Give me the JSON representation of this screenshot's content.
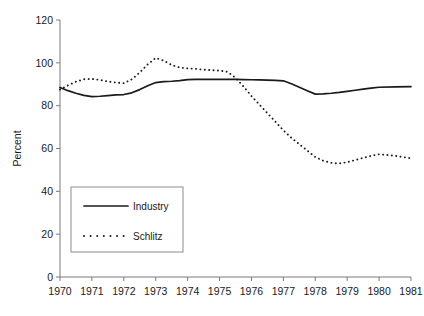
{
  "chart_data": {
    "type": "line",
    "title": "",
    "subtitle": "",
    "xlabel": "",
    "ylabel": "Percent",
    "xlim": [
      1970,
      1981
    ],
    "ylim": [
      0,
      120
    ],
    "grid": false,
    "legend_position": "inside-lower-left",
    "x_tick_labels": [
      "1970",
      "1971",
      "1972",
      "1973",
      "1974",
      "1975",
      "1976",
      "1977",
      "1978",
      "1979",
      "1980",
      "1981"
    ],
    "x_ticks": [
      1970,
      1971,
      1972,
      1973,
      1974,
      1975,
      1976,
      1977,
      1978,
      1979,
      1980,
      1981
    ],
    "y_tick_labels": [
      "0",
      "20",
      "40",
      "60",
      "80",
      "100",
      "120"
    ],
    "y_ticks": [
      0,
      20,
      40,
      60,
      80,
      100,
      120
    ],
    "series": [
      {
        "name": "Industry",
        "style": "solid",
        "color": "#1a1a1a",
        "x": [
          1970.0,
          1970.25,
          1970.5,
          1970.75,
          1971.0,
          1971.25,
          1971.5,
          1971.75,
          1972.0,
          1972.25,
          1972.5,
          1972.75,
          1973.0,
          1973.25,
          1973.5,
          1973.75,
          1974.0,
          1974.25,
          1974.5,
          1974.75,
          1975.0,
          1975.25,
          1975.5,
          1975.75,
          1976.0,
          1976.25,
          1976.5,
          1976.75,
          1977.0,
          1977.25,
          1977.5,
          1977.75,
          1978.0,
          1978.25,
          1978.5,
          1978.75,
          1979.0,
          1979.25,
          1979.5,
          1979.75,
          1980.0,
          1980.5,
          1981.0
        ],
        "values": [
          88.5,
          87.0,
          85.8,
          84.8,
          84.2,
          84.4,
          84.7,
          85.0,
          85.2,
          86.0,
          87.5,
          89.3,
          90.8,
          91.2,
          91.4,
          91.7,
          92.2,
          92.3,
          92.3,
          92.3,
          92.3,
          92.3,
          92.3,
          92.2,
          92.1,
          92.0,
          91.9,
          91.8,
          91.6,
          90.2,
          88.6,
          87.0,
          85.4,
          85.5,
          85.8,
          86.2,
          86.7,
          87.2,
          87.7,
          88.2,
          88.6,
          88.8,
          88.9
        ]
      },
      {
        "name": "Schlitz",
        "style": "dotted",
        "color": "#1a1a1a",
        "x": [
          1970.0,
          1970.25,
          1970.5,
          1970.75,
          1971.0,
          1971.25,
          1971.5,
          1971.75,
          1972.0,
          1972.25,
          1972.5,
          1972.75,
          1973.0,
          1973.25,
          1973.5,
          1973.75,
          1974.0,
          1974.25,
          1974.5,
          1974.75,
          1975.0,
          1975.25,
          1975.5,
          1975.75,
          1976.0,
          1976.25,
          1976.5,
          1976.75,
          1977.0,
          1977.25,
          1977.5,
          1977.75,
          1978.0,
          1978.25,
          1978.5,
          1978.75,
          1979.0,
          1979.25,
          1979.5,
          1979.75,
          1980.0,
          1980.25,
          1980.5,
          1980.75,
          1981.0
        ],
        "values": [
          87.5,
          89.5,
          91.2,
          92.3,
          92.5,
          92.0,
          91.3,
          90.8,
          90.5,
          92.3,
          95.5,
          99.3,
          102.3,
          101.0,
          99.0,
          97.8,
          97.4,
          97.2,
          96.8,
          96.6,
          96.4,
          95.8,
          93.0,
          89.0,
          84.5,
          80.5,
          76.5,
          72.5,
          68.5,
          65.0,
          62.0,
          59.0,
          56.0,
          54.3,
          53.3,
          53.0,
          53.6,
          54.6,
          55.6,
          56.6,
          57.3,
          57.0,
          56.6,
          56.0,
          55.4
        ]
      }
    ]
  },
  "legend": {
    "items": [
      {
        "label": "Industry",
        "style": "solid"
      },
      {
        "label": "Schlitz",
        "style": "dotted"
      }
    ]
  },
  "axes": {
    "y_title": "Percent"
  }
}
